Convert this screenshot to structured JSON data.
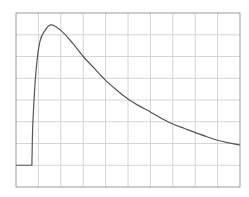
{
  "chart_data": {
    "type": "line",
    "title": "",
    "xlabel": "",
    "ylabel": "",
    "xlim": [
      0,
      10
    ],
    "ylim": [
      0,
      8
    ],
    "grid": true,
    "grid_divisions": {
      "x": 10,
      "y": 8
    },
    "legend": null,
    "series": [
      {
        "name": "signal",
        "color": "#555555",
        "x": [
          0,
          0.71,
          0.72,
          0.76,
          0.9,
          1.07,
          1.3,
          1.56,
          2.0,
          2.5,
          3.0,
          3.5,
          4.0,
          4.5,
          5.0,
          5.5,
          6.0,
          6.5,
          7.0,
          7.5,
          8.0,
          8.5,
          9.0,
          9.5,
          10.0
        ],
        "y": [
          1.0,
          1.0,
          1.6,
          3.1,
          5.4,
          6.7,
          7.2,
          7.45,
          7.2,
          6.65,
          6.0,
          5.45,
          4.9,
          4.45,
          4.05,
          3.73,
          3.45,
          3.15,
          2.9,
          2.7,
          2.5,
          2.32,
          2.15,
          2.03,
          1.93
        ]
      }
    ]
  },
  "colors": {
    "background": "#ffffff",
    "frame": "#9a9a9a",
    "grid": "#d4d4d4",
    "line": "#555555"
  }
}
